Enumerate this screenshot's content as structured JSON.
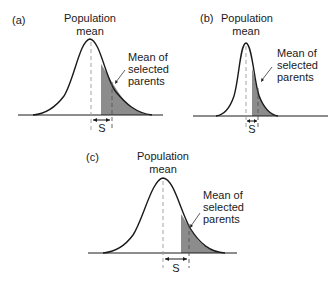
{
  "figure": {
    "panels": [
      {
        "id": "a",
        "label": "(a)",
        "population_mean_label": [
          "Population",
          "mean"
        ],
        "selected_label": [
          "Mean of",
          "selected",
          "parents"
        ],
        "selection_differential_label": "S",
        "distribution_width": "wide",
        "selection_differential": "medium"
      },
      {
        "id": "b",
        "label": "(b)",
        "population_mean_label": [
          "Population",
          "mean"
        ],
        "selected_label": [
          "Mean of",
          "selected",
          "parents"
        ],
        "selection_differential_label": "S",
        "distribution_width": "narrow",
        "selection_differential": "small"
      },
      {
        "id": "c",
        "label": "(c)",
        "population_mean_label": [
          "Population",
          "mean"
        ],
        "selected_label": [
          "Mean of",
          "selected",
          "parents"
        ],
        "selection_differential_label": "S",
        "distribution_width": "wide",
        "selection_differential": "large"
      }
    ],
    "colors": {
      "curve": "#1a1a1a",
      "shading": "#8c8c8c",
      "dashed": "#9a9a9a",
      "background": "#ffffff"
    }
  }
}
